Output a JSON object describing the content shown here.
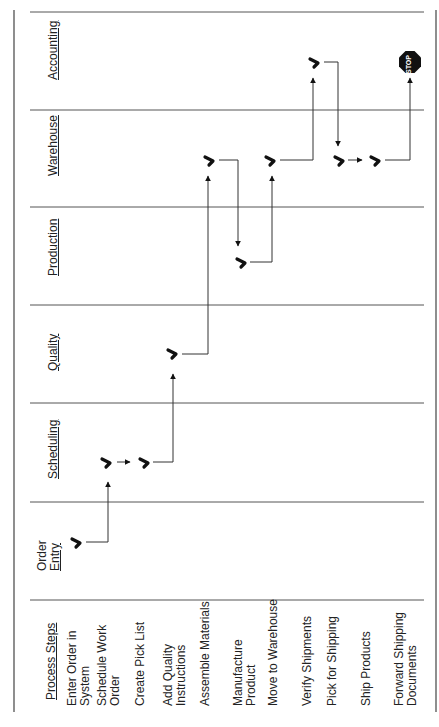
{
  "diagram": {
    "type": "swimlane-process-flow",
    "orientation": "rotated-90-ccw",
    "colors": {
      "line": "#3a3a3a",
      "mark": "#111111",
      "stop": "#111111",
      "background": "#ffffff"
    },
    "steps_header": "Process Steps",
    "lanes": [
      {
        "id": "order_entry",
        "label_line1": "Order",
        "label_line2": "Entry"
      },
      {
        "id": "scheduling",
        "label": "Scheduling"
      },
      {
        "id": "quality",
        "label": "Quality"
      },
      {
        "id": "production",
        "label": "Production"
      },
      {
        "id": "warehouse",
        "label": "Warehouse"
      },
      {
        "id": "accounting",
        "label": "Accounting"
      }
    ],
    "steps": [
      {
        "line1": "Enter Order in",
        "line2": "System",
        "lane": "order_entry"
      },
      {
        "line1": "Schedule Work",
        "line2": "Order",
        "lane": "scheduling"
      },
      {
        "line1": "Create Pick List",
        "line2": "",
        "lane": "scheduling"
      },
      {
        "line1": "Add Quality",
        "line2": "Instructions",
        "lane": "quality"
      },
      {
        "line1": "Assemble Materials",
        "line2": "",
        "lane": "warehouse"
      },
      {
        "line1": "Manufacture",
        "line2": "Product",
        "lane": "production"
      },
      {
        "line1": "Move to Warehouse",
        "line2": "",
        "lane": "warehouse"
      },
      {
        "line1": "Verify Shipments",
        "line2": "",
        "lane": "accounting"
      },
      {
        "line1": "Pick for Shipping",
        "line2": "",
        "lane": "warehouse"
      },
      {
        "line1": "Ship Products",
        "line2": "",
        "lane": "warehouse"
      },
      {
        "line1": "Forward Shipping",
        "line2": "Documents",
        "lane": "accounting"
      }
    ],
    "end_marker": {
      "label": "STOP",
      "lane": "accounting"
    }
  }
}
